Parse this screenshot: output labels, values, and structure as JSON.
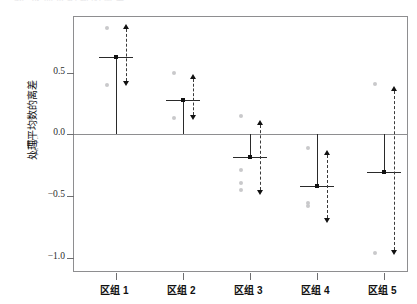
{
  "figure": {
    "top_clipped_caption": "图  处理平均数的离差",
    "background_color": "#ffffff",
    "frame_color": "#8e8e90",
    "point_color": "#c9c9cb",
    "line_color": "#2a2a2a"
  },
  "chart_data": {
    "type": "scatter",
    "title": "",
    "subtitle": "",
    "xlabel": "",
    "ylabel": "处理平均数的离差",
    "ylabel_formula": "yᵢ. − ȳ..",
    "ylabel_formula_main": "y",
    "ylabel_formula_sub": "i.",
    "ylabel_formula_tail": "−y",
    "ylabel_formula_tail_sub": "..",
    "grid": false,
    "legend": "none",
    "ylim": [
      -1.12,
      0.95
    ],
    "yticks": [
      0.5,
      0.0,
      -0.5,
      -1.0
    ],
    "ytick_labels": [
      "0.5",
      "0.0",
      "−0.5",
      "−1.0"
    ],
    "zero_reference": 0.0,
    "categories": [
      "区组 1",
      "区组 2",
      "区组 3",
      "区组 4",
      "区组 5"
    ],
    "series": [
      {
        "name": "处理平均数离差",
        "values": [
          0.63,
          0.28,
          -0.18,
          -0.42,
          -0.3
        ]
      },
      {
        "name": "观测值上限",
        "values": [
          0.86,
          0.5,
          0.15,
          -0.11,
          0.41
        ]
      },
      {
        "name": "观测值下限",
        "values": [
          0.4,
          0.13,
          -0.45,
          -0.58,
          -0.96
        ]
      }
    ],
    "points": [
      {
        "category": "区组 1",
        "mean": 0.63,
        "range_high": 0.86,
        "range_low": 0.4,
        "observations": [
          0.86,
          0.4
        ]
      },
      {
        "category": "区组 2",
        "mean": 0.28,
        "range_high": 0.5,
        "range_low": 0.13,
        "observations": [
          0.5,
          0.13
        ]
      },
      {
        "category": "区组 3",
        "mean": -0.18,
        "range_high": 0.15,
        "range_low": -0.45,
        "observations": [
          0.15,
          -0.29,
          -0.39,
          -0.45
        ]
      },
      {
        "category": "区组 4",
        "mean": -0.42,
        "range_high": -0.11,
        "range_low": -0.58,
        "observations": [
          -0.11,
          -0.55,
          -0.58
        ]
      },
      {
        "category": "区组 5",
        "mean": -0.3,
        "range_high": 0.41,
        "range_low": -0.96,
        "observations": [
          0.41,
          -0.96
        ]
      }
    ],
    "arrow_spans": [
      {
        "category": "区组 1",
        "top": 0.855,
        "bottom": 0.435
      },
      {
        "category": "区组 2",
        "top": 0.445,
        "bottom": 0.155
      },
      {
        "category": "区组 3",
        "top": 0.075,
        "bottom": -0.445
      },
      {
        "category": "区组 4",
        "top": -0.165,
        "bottom": -0.675
      },
      {
        "category": "区组 5",
        "top": 0.355,
        "bottom": -0.935
      }
    ]
  }
}
